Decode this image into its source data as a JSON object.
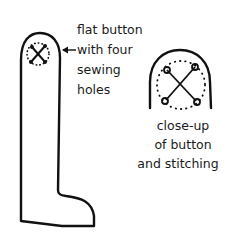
{
  "figure": {
    "callout_label": {
      "lines": [
        "flat button",
        "with four",
        "sewing",
        "holes"
      ]
    },
    "closeup_caption": {
      "lines": [
        "close-up",
        "of button",
        "and stitching"
      ]
    },
    "colors": {
      "ink": "#111111",
      "background": "#ffffff"
    }
  }
}
